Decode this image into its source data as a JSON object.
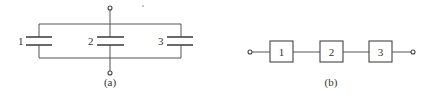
{
  "figure_a": {
    "caption": "(a)",
    "description": "Three capacitors connected in parallel",
    "components": [
      {
        "id": "1",
        "label": "1",
        "type": "capacitor"
      },
      {
        "id": "2",
        "label": "2",
        "type": "capacitor"
      },
      {
        "id": "3",
        "label": "3",
        "type": "capacitor"
      }
    ],
    "terminals": [
      "top",
      "bottom"
    ]
  },
  "figure_b": {
    "caption": "(b)",
    "description": "Three blocks connected in series",
    "components": [
      {
        "id": "1",
        "label": "1",
        "type": "block"
      },
      {
        "id": "2",
        "label": "2",
        "type": "block"
      },
      {
        "id": "3",
        "label": "3",
        "type": "block"
      }
    ],
    "terminals": [
      "left",
      "right"
    ]
  },
  "colors": {
    "line": "#555555",
    "text": "#333333",
    "background": "#ffffff"
  }
}
